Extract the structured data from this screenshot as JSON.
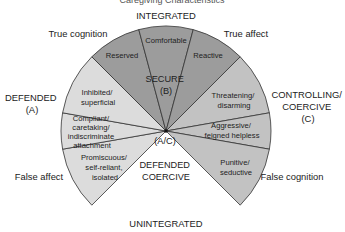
{
  "title_cut": "Caregiving  Characteristics",
  "axes": {
    "top": "INTEGRATED",
    "bottom": "UNINTEGRATED"
  },
  "corners": {
    "top_left": "True cognition",
    "top_right": "True affect",
    "bottom_left": "False affect",
    "bottom_right": "False cognition"
  },
  "groups": {
    "defended": {
      "line1": "DEFENDED",
      "line2": "(A)"
    },
    "secure": {
      "line1": "SECURE",
      "line2": "(B)"
    },
    "controlling": {
      "line1": "CONTROLLING/",
      "line2": "COERCIVE",
      "line3": "(C)"
    },
    "defended_coercive": {
      "line1": "DEFENDED",
      "line2": "COERCIVE"
    },
    "center_label": "(A/C)"
  },
  "colors": {
    "defended": "#dcdcdc",
    "secure": "#9c9c9c",
    "coercive": "#c2c2c2",
    "stroke": "#333333"
  },
  "segments": [
    {
      "group": "defended",
      "lines": [
        "Promiscuous/",
        "self-reliant,",
        "isolated"
      ],
      "start": -135,
      "end": -100
    },
    {
      "group": "defended",
      "lines": [
        "Compliant/",
        "caretaking/",
        "indiscriminate",
        "attachment"
      ],
      "start": -100,
      "end": -80
    },
    {
      "group": "defended",
      "lines": [
        "Inhibited/",
        "superficial"
      ],
      "start": -80,
      "end": -45
    },
    {
      "group": "secure",
      "lines": [
        "Reserved"
      ],
      "start": -45,
      "end": -15
    },
    {
      "group": "secure",
      "lines": [
        "Comfortable"
      ],
      "start": -15,
      "end": 15
    },
    {
      "group": "secure",
      "lines": [
        "Reactive"
      ],
      "start": 15,
      "end": 45
    },
    {
      "group": "coercive",
      "lines": [
        "Threatening/",
        "disarming"
      ],
      "start": 45,
      "end": 80
    },
    {
      "group": "coercive",
      "lines": [
        "Aggressive/",
        "feigned helpless"
      ],
      "start": 80,
      "end": 100
    },
    {
      "group": "coercive",
      "lines": [
        "Punitive/",
        "seductive"
      ],
      "start": 100,
      "end": 135
    }
  ]
}
